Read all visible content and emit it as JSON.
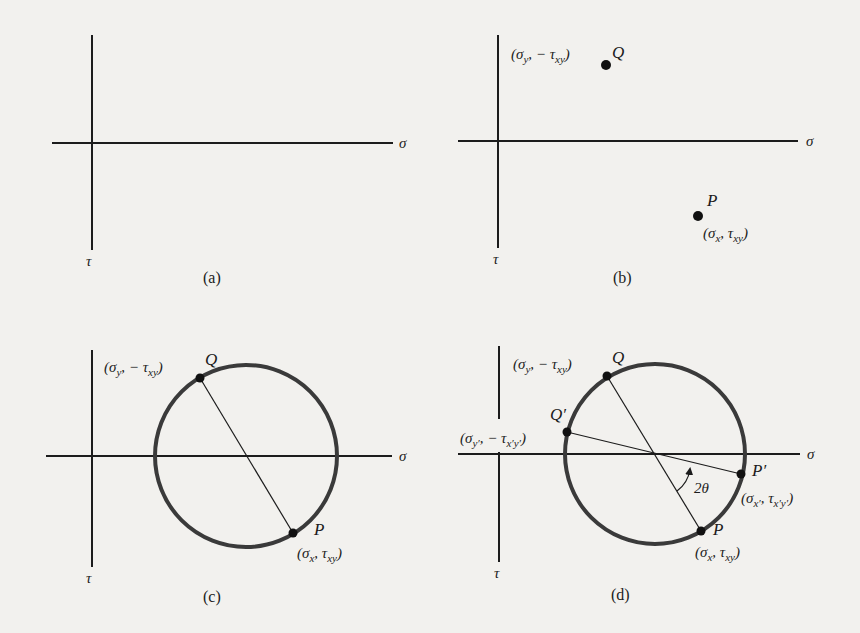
{
  "figure": {
    "axis_labels": {
      "horizontal": "σ",
      "vertical": "τ"
    },
    "panels": [
      {
        "id": "a",
        "caption": "(a)",
        "content": "empty σ–τ axes"
      },
      {
        "id": "b",
        "caption": "(b)",
        "points": [
          {
            "name": "Q",
            "coords": "(σy, −τxy)"
          },
          {
            "name": "P",
            "coords": "(σx, τxy)"
          }
        ]
      },
      {
        "id": "c",
        "caption": "(c)",
        "points": [
          {
            "name": "Q",
            "coords": "(σy, −τxy)"
          },
          {
            "name": "P",
            "coords": "(σx, τxy)"
          }
        ],
        "shapes": [
          "circle",
          "diameter PQ"
        ]
      },
      {
        "id": "d",
        "caption": "(d)",
        "points": [
          {
            "name": "Q",
            "coords": "(σy, −τxy)"
          },
          {
            "name": "Q′",
            "coords": "(σy′, −τx′y′)"
          },
          {
            "name": "P′",
            "coords": "(σx′, τx′y′)"
          },
          {
            "name": "P",
            "coords": "(σx, τxy)"
          }
        ],
        "shapes": [
          "circle",
          "diameter PQ",
          "diameter P′Q′"
        ],
        "angle_label": "2θ"
      }
    ]
  },
  "labels": {
    "sigma": "σ",
    "tau": "τ",
    "cap_a": "(a)",
    "cap_b": "(b)",
    "cap_c": "(c)",
    "cap_d": "(d)",
    "Q": "Q",
    "P": "P",
    "Qp": "Q′",
    "Pp": "P′",
    "two_theta": "2θ"
  }
}
